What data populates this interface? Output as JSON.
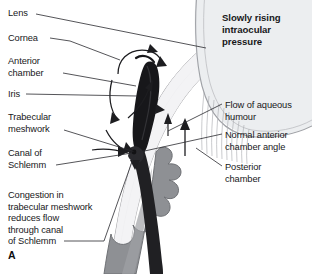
{
  "figure": {
    "panel_letter": "A",
    "title": "Slowly rising\nintraocular\npressure",
    "background_color": "#ffffff",
    "text_color": "#18181a"
  },
  "labels_left": [
    {
      "key": "lens",
      "text": "Lens"
    },
    {
      "key": "cornea",
      "text": "Cornea"
    },
    {
      "key": "anterior_chamber",
      "text": "Anterior\nchamber"
    },
    {
      "key": "iris",
      "text": "Iris"
    },
    {
      "key": "trabecular_meshwork",
      "text": "Trabecular\nmeshwork"
    },
    {
      "key": "canal_of_schlemm",
      "text": "Canal of\nSchlemm"
    },
    {
      "key": "congestion",
      "text": "Congestion in\ntrabecular meshwork\nreduces flow\nthrough canal\nof Schlemm"
    }
  ],
  "labels_right": [
    {
      "key": "flow_of_aqueous_humour",
      "text": "Flow of aqueous\nhumour"
    },
    {
      "key": "normal_anterior_chamber_angle",
      "text": "Normal anterior\nchamber angle"
    },
    {
      "key": "posterior_chamber",
      "text": "Posterior\nchamber"
    }
  ],
  "anatomy_colors": {
    "iris_dark": "#1a1a1c",
    "ciliary_body_gray": "#8e8e90",
    "sclera_light": "#e6e6e8",
    "cornea_tint": "#f0f0f2",
    "outline": "#6e6e72",
    "leader_line": "#2a2a2e"
  }
}
